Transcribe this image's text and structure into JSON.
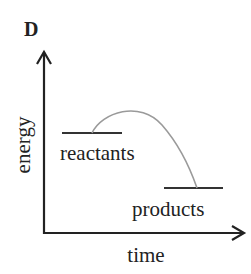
{
  "figure": {
    "panel_label": "D",
    "type": "energy-reaction-diagram",
    "axes": {
      "y_label": "energy",
      "x_label": "time"
    },
    "levels": [
      {
        "name": "reactants",
        "label": "reactants"
      },
      {
        "name": "products",
        "label": "products"
      }
    ],
    "curve": {
      "description": "activation energy hump from reactants to products",
      "color": "#9a9a9a"
    },
    "colors": {
      "axis": "#222222",
      "level_line": "#333333",
      "curve": "#9a9a9a",
      "text": "#222222"
    }
  }
}
